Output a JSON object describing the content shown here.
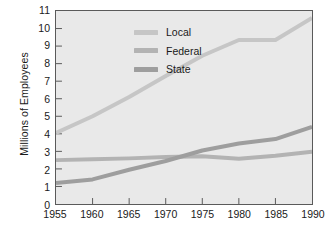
{
  "chart_data": {
    "type": "line",
    "title": "",
    "xlabel": "",
    "ylabel": "Millions of Employees",
    "xlim": [
      1955,
      1990
    ],
    "ylim": [
      0,
      11
    ],
    "grid": false,
    "legend_position": "top-left inside plot",
    "xticks": [
      "1955",
      "1960",
      "1965",
      "1970",
      "1975",
      "1980",
      "1985",
      "1990"
    ],
    "yticks": [
      "0",
      "1",
      "2",
      "3",
      "4",
      "5",
      "6",
      "7",
      "8",
      "9",
      "10",
      "11"
    ],
    "x": [
      1955,
      1960,
      1965,
      1970,
      1975,
      1980,
      1985,
      1990
    ],
    "series": [
      {
        "name": "Local",
        "color": "#c6c6c6",
        "values": [
          4.05,
          5.0,
          6.1,
          7.3,
          8.45,
          9.35,
          9.35,
          10.6
        ]
      },
      {
        "name": "Federal",
        "color": "#b3b3b3",
        "values": [
          2.5,
          2.55,
          2.6,
          2.68,
          2.72,
          2.58,
          2.75,
          2.98
        ]
      },
      {
        "name": "State",
        "color": "#9e9e9e",
        "values": [
          1.2,
          1.4,
          1.95,
          2.45,
          3.05,
          3.45,
          3.7,
          4.4
        ]
      }
    ]
  },
  "axis": {
    "y_title": "Millions of Employees"
  },
  "legend": {
    "items": [
      {
        "label": "Local",
        "color": "#c6c6c6"
      },
      {
        "label": "Federal",
        "color": "#b3b3b3"
      },
      {
        "label": "State",
        "color": "#9e9e9e"
      }
    ]
  },
  "style": {
    "plot_background": "#e9e9e9",
    "plot_border": "#5a5a5a",
    "text_color": "#1a1a1a",
    "page_background": "#ffffff"
  }
}
